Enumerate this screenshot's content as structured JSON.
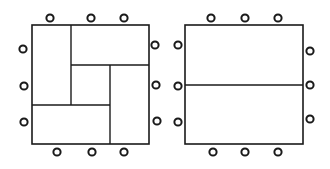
{
  "diagram": {
    "colors": {
      "stroke": "#1a1a1a",
      "background": "#ffffff"
    },
    "figures": [
      {
        "name": "left-arrangement",
        "outer": {
          "x": 32,
          "y": 25,
          "w": 117,
          "h": 119
        },
        "lines": [
          {
            "x1": 71,
            "y1": 25,
            "x2": 71,
            "y2": 105
          },
          {
            "x1": 71,
            "y1": 65,
            "x2": 149,
            "y2": 65
          },
          {
            "x1": 110,
            "y1": 65,
            "x2": 110,
            "y2": 144
          },
          {
            "x1": 32,
            "y1": 105,
            "x2": 110,
            "y2": 105
          }
        ],
        "seats": [
          {
            "cx": 50,
            "cy": 18
          },
          {
            "cx": 91,
            "cy": 18
          },
          {
            "cx": 124,
            "cy": 18
          },
          {
            "cx": 23,
            "cy": 49
          },
          {
            "cx": 24,
            "cy": 86
          },
          {
            "cx": 24,
            "cy": 122
          },
          {
            "cx": 155,
            "cy": 45
          },
          {
            "cx": 156,
            "cy": 85
          },
          {
            "cx": 157,
            "cy": 121
          },
          {
            "cx": 57,
            "cy": 152
          },
          {
            "cx": 92,
            "cy": 152
          },
          {
            "cx": 124,
            "cy": 152
          }
        ]
      },
      {
        "name": "right-arrangement",
        "outer": {
          "x": 185,
          "y": 25,
          "w": 118,
          "h": 119
        },
        "lines": [
          {
            "x1": 185,
            "y1": 85,
            "x2": 303,
            "y2": 85
          }
        ],
        "seats": [
          {
            "cx": 211,
            "cy": 18
          },
          {
            "cx": 245,
            "cy": 18
          },
          {
            "cx": 278,
            "cy": 18
          },
          {
            "cx": 178,
            "cy": 45
          },
          {
            "cx": 178,
            "cy": 86
          },
          {
            "cx": 178,
            "cy": 122
          },
          {
            "cx": 310,
            "cy": 51
          },
          {
            "cx": 310,
            "cy": 85
          },
          {
            "cx": 310,
            "cy": 119
          },
          {
            "cx": 213,
            "cy": 152
          },
          {
            "cx": 245,
            "cy": 152
          },
          {
            "cx": 278,
            "cy": 152
          }
        ]
      }
    ]
  }
}
